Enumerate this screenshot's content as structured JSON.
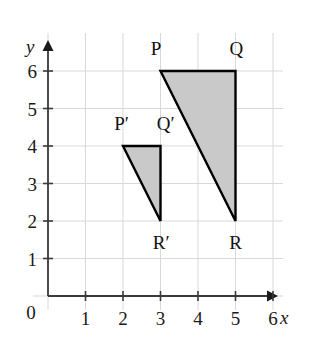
{
  "figure": {
    "title": "",
    "background_color": "#ffffff"
  },
  "chart_data": {
    "type": "scatter",
    "title": "",
    "xlabel": "x",
    "ylabel": "y",
    "xlim": [
      0,
      6.4
    ],
    "ylim": [
      0,
      6.4
    ],
    "xticks": [
      0,
      1,
      2,
      3,
      4,
      5,
      6
    ],
    "yticks": [
      0,
      1,
      2,
      3,
      4,
      5,
      6
    ],
    "xtick_labels": [
      "0",
      "1",
      "2",
      "3",
      "4",
      "5",
      "6"
    ],
    "ytick_labels": [
      "0",
      "1",
      "2",
      "3",
      "4",
      "5",
      "6"
    ],
    "grid": true,
    "grid_color": "#d9d9d9",
    "axis_color": "#3a3a3a",
    "legend": false,
    "origin_label": "0",
    "shapes": [
      {
        "name": "triangle-PQR",
        "kind": "polygon",
        "fill": "#c9c9c9",
        "stroke": "#000000",
        "stroke_width": 2.4,
        "vertices": [
          {
            "label": "P",
            "x": 3,
            "y": 6,
            "label_dx": -0.12,
            "label_dy": 0.62
          },
          {
            "label": "Q",
            "x": 5,
            "y": 6,
            "label_dx": 0.02,
            "label_dy": 0.62
          },
          {
            "label": "R",
            "x": 5,
            "y": 2,
            "label_dx": 0.0,
            "label_dy": -0.55
          }
        ]
      },
      {
        "name": "triangle-P-prime-Q-prime-R-prime",
        "kind": "polygon",
        "fill": "#c9c9c9",
        "stroke": "#000000",
        "stroke_width": 2.4,
        "vertices": [
          {
            "label": "P′",
            "x": 2,
            "y": 4,
            "label_dx": -0.04,
            "label_dy": 0.62
          },
          {
            "label": "Q′",
            "x": 3,
            "y": 4,
            "label_dx": 0.14,
            "label_dy": 0.62
          },
          {
            "label": "R′",
            "x": 3,
            "y": 2,
            "label_dx": 0.02,
            "label_dy": -0.55
          }
        ]
      }
    ]
  },
  "axes": {
    "x_axis_name": "x",
    "y_axis_name": "y",
    "x_arrow": true,
    "y_arrow": true
  }
}
